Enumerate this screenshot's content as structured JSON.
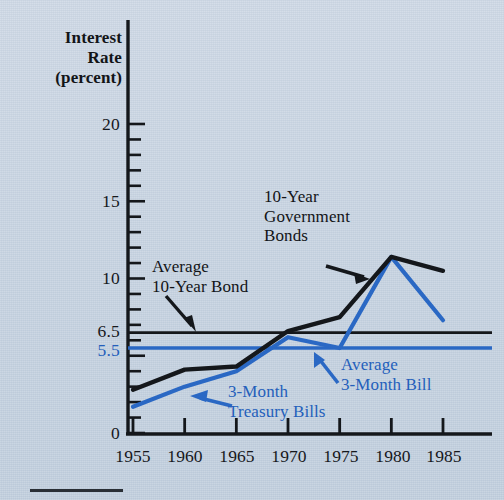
{
  "figure": {
    "background_color": "#c7d3e1",
    "line_color_bonds": "#14171b",
    "line_color_bills": "#2a68c4"
  },
  "axis": {
    "y_title_line1": "Interest",
    "y_title_line2": "Rate",
    "y_title_line3": "(percent)",
    "y_ticks": [
      "0",
      "5.5",
      "6.5",
      "10",
      "15",
      "20"
    ],
    "x_ticks": [
      "1955",
      "1960",
      "1965",
      "1970",
      "1975",
      "1980",
      "1985"
    ]
  },
  "annotations": {
    "bonds_line1": "10-Year",
    "bonds_line2": "Government",
    "bonds_line3": "Bonds",
    "avg_bond_line1": "Average",
    "avg_bond_line2": "10-Year Bond",
    "bills_line1": "3-Month",
    "bills_line2": "Treasury Bills",
    "avg_bill_line1": "Average",
    "avg_bill_line2": "3-Month Bill"
  },
  "chart_data": {
    "type": "line",
    "title": "",
    "xlabel": "",
    "ylabel": "Interest Rate (percent)",
    "xlim": [
      1953,
      1987
    ],
    "ylim": [
      0,
      20.5
    ],
    "grid": false,
    "legend": "annotations-inline",
    "x": [
      1955,
      1960,
      1965,
      1970,
      1975,
      1980,
      1985
    ],
    "series": [
      {
        "name": "10-Year Government Bonds",
        "color": "#14171b",
        "values": [
          2.8,
          4.1,
          4.3,
          6.6,
          7.5,
          11.4,
          10.5
        ]
      },
      {
        "name": "3-Month Treasury Bills",
        "color": "#2a68c4",
        "values": [
          1.7,
          3.0,
          4.0,
          6.2,
          5.5,
          11.4,
          7.3
        ]
      }
    ],
    "reference_lines": [
      {
        "name": "Average 10-Year Bond",
        "value": 6.5,
        "color": "#14171b"
      },
      {
        "name": "Average 3-Month Bill",
        "value": 5.5,
        "color": "#2a68c4"
      }
    ],
    "y_major_ticks": [
      0,
      5.5,
      6.5,
      10,
      15,
      20
    ],
    "y_minor_tick_step": 1
  }
}
